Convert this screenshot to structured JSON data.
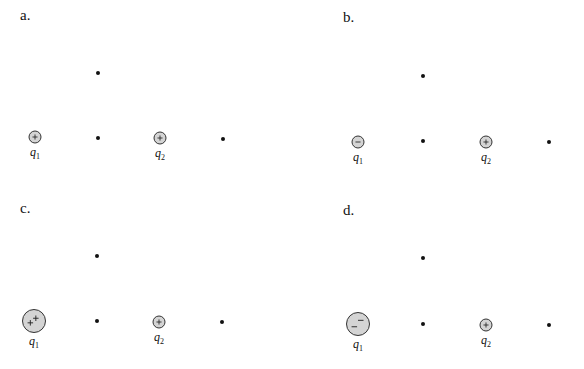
{
  "panels": [
    {
      "label": "a.",
      "q1": {
        "name": "q",
        "sub": "1",
        "sign": "+",
        "size": "small"
      },
      "q2": {
        "name": "q",
        "sub": "2",
        "sign": "+",
        "size": "small"
      }
    },
    {
      "label": "b.",
      "q1": {
        "name": "q",
        "sub": "1",
        "sign": "−",
        "size": "small"
      },
      "q2": {
        "name": "q",
        "sub": "2",
        "sign": "+",
        "size": "small"
      }
    },
    {
      "label": "c.",
      "q1": {
        "name": "q",
        "sub": "1",
        "sign": "++",
        "size": "large"
      },
      "q2": {
        "name": "q",
        "sub": "2",
        "sign": "+",
        "size": "small"
      }
    },
    {
      "label": "d.",
      "q1": {
        "name": "q",
        "sub": "1",
        "sign": "−−",
        "size": "large"
      },
      "q2": {
        "name": "q",
        "sub": "2",
        "sign": "+",
        "size": "small"
      }
    }
  ],
  "colors": {
    "charge_fill": "#d4d4d4",
    "stroke": "#333333",
    "dot": "#111111"
  }
}
